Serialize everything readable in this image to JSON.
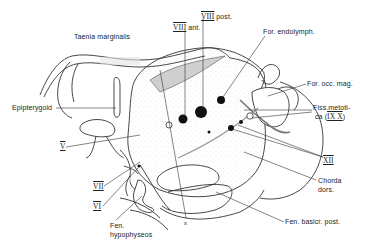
{
  "figure": {
    "type": "anatomical line drawing",
    "labels": {
      "taenia_marginalis": "Taenia marginalis",
      "epipterygoid": "Epipterygoid",
      "nerve_v": "V",
      "nerve_vii": "VII",
      "nerve_vi": "VI",
      "fen_hypophyseos_1": "Fen.",
      "fen_hypophyseos_2": "hypophyseos",
      "viii_ant_num": "VIII",
      "viii_ant_txt": "ant.",
      "viii_post_num": "VIII",
      "viii_post_txt": "post.",
      "for_endolymph": "For. endolymph.",
      "for_occ_mag": "For. occ. mag.",
      "fiss_metotica_1": "Fiss.metoti-",
      "fiss_metotica_2a": "ca (",
      "fiss_metotica_roman": "IX X",
      "fiss_metotica_2b": ")",
      "nerve_xii": "XII",
      "chorda_dors_1": "Chorda",
      "chorda_dors_2": "dors.",
      "fen_basicr_post": "Fen. basicr. post.",
      "x_mark": "x"
    },
    "colors": {
      "ink": "#222222",
      "stipple": "#9a9a9a",
      "shade": "#d8d8d8",
      "background": "#ffffff"
    }
  }
}
